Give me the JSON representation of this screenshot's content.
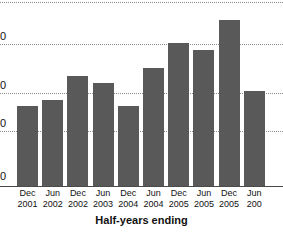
{
  "chart_data": {
    "type": "bar",
    "title": "",
    "xlabel": "Half-years ending",
    "ylabel": "",
    "grid": true,
    "legend": null,
    "note": "Image is cropped: y-axis tick labels are truncated at the left edge so only the trailing '0' of each number is visible; the rightmost bar and its year label are cut off at the right edge.",
    "categories": [
      "Dec 2001",
      "Jun 2002",
      "Dec 2002",
      "Jun 2003",
      "Dec 2004",
      "Jun 2004",
      "Dec 2005",
      "Jun 2005",
      "Dec 2005",
      "Jun 200"
    ],
    "category_months": [
      "Dec",
      "Jun",
      "Dec",
      "Jun",
      "Dec",
      "Jun",
      "Dec",
      "Jun",
      "Dec",
      "Jun"
    ],
    "category_years": [
      "2001",
      "2002",
      "2002",
      "2003",
      "2004",
      "2004",
      "2005",
      "2005",
      "2005",
      "200"
    ],
    "values": [
      48,
      52,
      66,
      62,
      48,
      71,
      86,
      82,
      100,
      57
    ],
    "ylim": [
      0,
      112
    ],
    "ytick_labels": [
      "0",
      "0",
      "0",
      "0"
    ],
    "ytick_values": [
      97,
      68,
      46,
      19
    ],
    "bar_color": "#595959",
    "grid_color": "#8d8d8d",
    "axis_color": "#4a4a4a",
    "background_color": "#ffffff",
    "bar_pixel_tops": [
      108,
      102,
      80,
      85,
      108,
      72,
      47,
      53,
      25,
      95
    ],
    "baseline_pixel_y": 186
  },
  "axis": {
    "x_title": "Half-years ending",
    "y_ticks": [
      {
        "label": "0",
        "pixel_y": 37
      },
      {
        "label": "0",
        "pixel_y": 86
      },
      {
        "label": "0",
        "pixel_y": 124
      },
      {
        "label": "0",
        "pixel_y": 177
      }
    ],
    "gridlines_pixel_y": [
      2,
      44,
      93,
      131
    ]
  }
}
